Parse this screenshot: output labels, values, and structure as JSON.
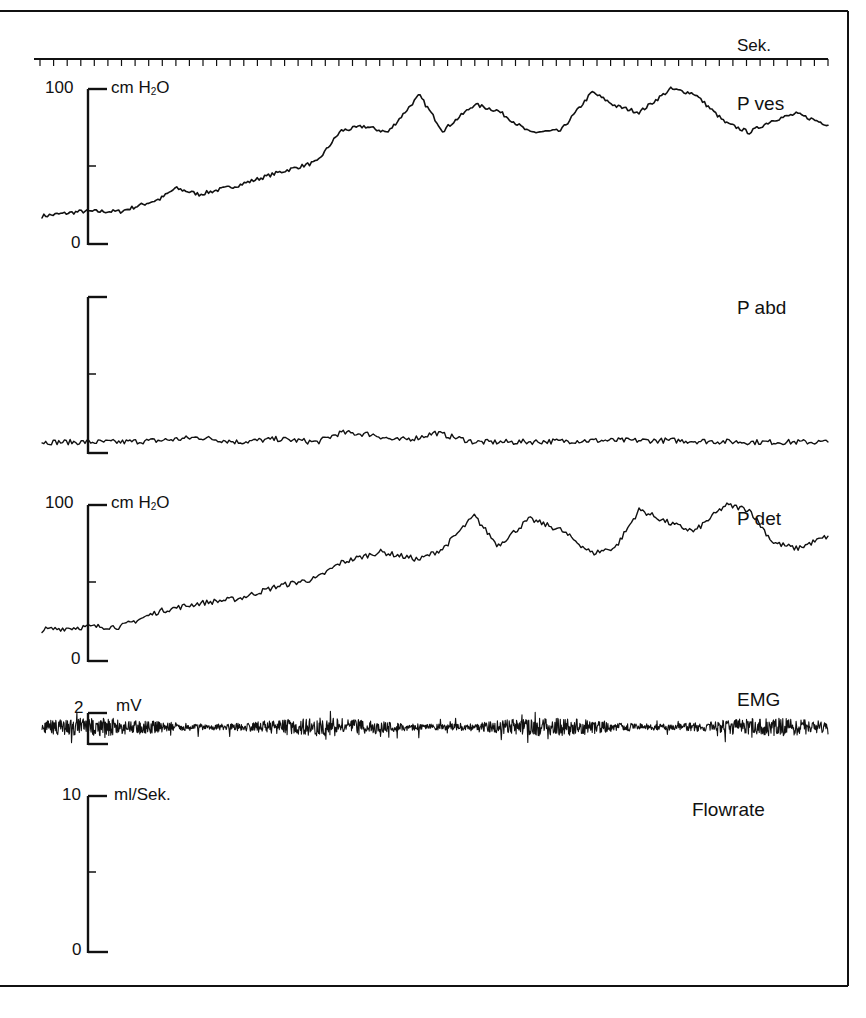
{
  "figure": {
    "time_axis": {
      "unit_label": "Sek.",
      "tick_count": 59
    },
    "channels": [
      {
        "id": "pves",
        "label": "P ves",
        "unit": "cm H2O",
        "unit_main": "cm H",
        "unit_sub": "2",
        "unit_tail": "O",
        "max_label": "100",
        "min_label": "0"
      },
      {
        "id": "pabd",
        "label": "P abd",
        "unit": "",
        "max_label": "",
        "min_label": ""
      },
      {
        "id": "pdet",
        "label": "P det",
        "unit": "cm H2O",
        "unit_main": "cm H",
        "unit_sub": "2",
        "unit_tail": "O",
        "max_label": "100",
        "min_label": "0"
      },
      {
        "id": "emg",
        "label": "EMG",
        "unit": "mV",
        "max_label": "2",
        "min_label": ""
      },
      {
        "id": "flow",
        "label": "Flowrate",
        "unit": "ml/Sek.",
        "max_label": "10",
        "min_label": "0"
      }
    ]
  },
  "chart_data": {
    "type": "line",
    "title": "",
    "xlabel": "Sek.",
    "x_range_ticks": 59,
    "layout": {
      "grid": false,
      "legend": "inline labels at right",
      "stacked_panels": 5
    },
    "series": [
      {
        "name": "P ves",
        "unit": "cm H2O",
        "ylim": [
          0,
          100
        ],
        "x_frac": [
          0.0,
          0.05,
          0.1,
          0.15,
          0.17,
          0.2,
          0.25,
          0.3,
          0.35,
          0.38,
          0.41,
          0.44,
          0.48,
          0.51,
          0.55,
          0.58,
          0.62,
          0.66,
          0.7,
          0.73,
          0.76,
          0.8,
          0.83,
          0.87,
          0.9,
          0.93,
          0.96,
          1.0
        ],
        "values": [
          18,
          21,
          21,
          29,
          36,
          32,
          38,
          46,
          53,
          73,
          76,
          72,
          96,
          73,
          90,
          86,
          72,
          73,
          98,
          89,
          85,
          100,
          97,
          78,
          72,
          80,
          84,
          77
        ]
      },
      {
        "name": "P abd",
        "unit": "cm H2O",
        "ylim": [
          0,
          100
        ],
        "x_frac": [
          0.0,
          0.1,
          0.15,
          0.2,
          0.25,
          0.3,
          0.35,
          0.38,
          0.42,
          0.45,
          0.48,
          0.5,
          0.55,
          0.6,
          0.7,
          0.8,
          0.9,
          1.0
        ],
        "values": [
          7,
          7,
          8,
          10,
          7,
          9,
          7,
          13,
          12,
          8,
          10,
          13,
          7,
          7,
          8,
          8,
          7,
          7
        ]
      },
      {
        "name": "P det",
        "unit": "cm H2O",
        "ylim": [
          0,
          100
        ],
        "x_frac": [
          0.0,
          0.06,
          0.1,
          0.15,
          0.2,
          0.25,
          0.3,
          0.35,
          0.38,
          0.43,
          0.48,
          0.51,
          0.55,
          0.58,
          0.62,
          0.66,
          0.7,
          0.73,
          0.76,
          0.8,
          0.83,
          0.87,
          0.9,
          0.93,
          0.96,
          1.0
        ],
        "values": [
          20,
          22,
          22,
          32,
          37,
          40,
          48,
          53,
          63,
          70,
          65,
          72,
          93,
          74,
          91,
          84,
          69,
          73,
          97,
          88,
          83,
          100,
          97,
          76,
          72,
          80,
          86,
          76
        ]
      },
      {
        "name": "EMG",
        "unit": "mV",
        "ylim": [
          -2,
          2
        ],
        "description": "continuous noisy EMG activity, amplitude ~±1 mV throughout"
      },
      {
        "name": "Flowrate",
        "unit": "ml/Sek.",
        "ylim": [
          0,
          10
        ],
        "values": []
      }
    ]
  }
}
